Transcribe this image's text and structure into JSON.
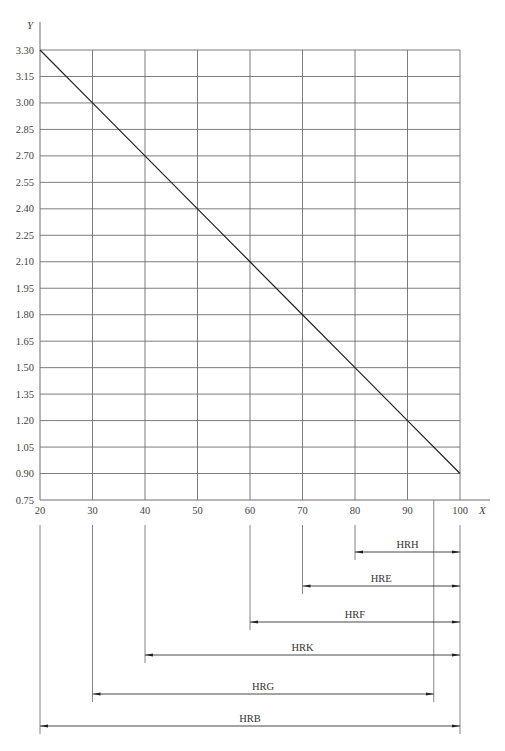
{
  "chart_data": {
    "type": "line",
    "title": "",
    "xlabel": "X",
    "ylabel": "Y",
    "xlim": [
      20,
      100
    ],
    "ylim": [
      0.75,
      3.3
    ],
    "grid": true,
    "x_ticks": [
      20,
      30,
      40,
      50,
      60,
      70,
      80,
      90,
      100
    ],
    "x_tick_labels": [
      "20",
      "30",
      "40",
      "50",
      "60",
      "70",
      "80",
      "90",
      "100"
    ],
    "y_ticks": [
      0.75,
      0.9,
      1.05,
      1.2,
      1.35,
      1.5,
      1.65,
      1.8,
      1.95,
      2.1,
      2.25,
      2.4,
      2.55,
      2.7,
      2.85,
      3.0,
      3.15,
      3.3
    ],
    "y_tick_labels": [
      "0.75",
      "0.90",
      "1.05",
      "1.20",
      "1.35",
      "1.50",
      "1.65",
      "1.80",
      "1.95",
      "2.10",
      "2.25",
      "2.40",
      "2.55",
      "2.70",
      "2.85",
      "3.00",
      "3.15",
      "3.30"
    ],
    "series": [
      {
        "name": "Y vs X",
        "x": [
          20,
          30,
          40,
          50,
          60,
          70,
          80,
          90,
          100
        ],
        "values": [
          3.3,
          3.0,
          2.7,
          2.4,
          2.1,
          1.8,
          1.5,
          1.2,
          0.9
        ]
      }
    ],
    "scale_ranges": [
      {
        "label": "HRH",
        "from": 80,
        "to": 100
      },
      {
        "label": "HRE",
        "from": 70,
        "to": 100
      },
      {
        "label": "HRF",
        "from": 60,
        "to": 100
      },
      {
        "label": "HRK",
        "from": 40,
        "to": 100
      },
      {
        "label": "HRG",
        "from": 30,
        "to": 95
      },
      {
        "label": "HRB",
        "from": 20,
        "to": 100
      }
    ],
    "legend": "none"
  },
  "axes": {
    "x_letter": "X",
    "y_letter": "Y"
  },
  "colors": {
    "grid": "#6e6e6e",
    "line": "#222222",
    "text": "#444444"
  }
}
